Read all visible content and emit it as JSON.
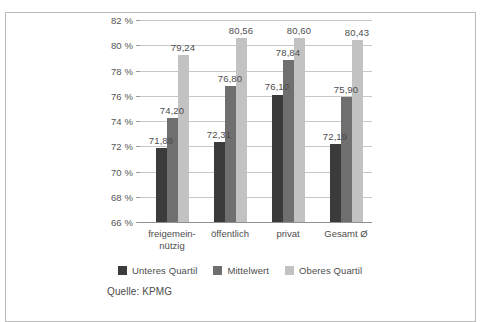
{
  "figure": {
    "source_note": "Quelle: KPMG"
  },
  "colors": {
    "series_lower": "#3b3b3b",
    "series_mean": "#6f6f6f",
    "series_upper": "#c2c2c2",
    "gridline": "#c8c8c8",
    "axis": "#8f8f8f",
    "frame": "#b9b9b9",
    "text": "#4d4d4d",
    "background": "#ffffff"
  },
  "chart_data": {
    "type": "bar",
    "title": "",
    "subtitle": "",
    "xlabel": "",
    "ylabel": "",
    "ylim": [
      66,
      82
    ],
    "ytick_step": 2,
    "ytick_labels": [
      "82 %",
      "80 %",
      "78 %",
      "76 %",
      "74 %",
      "72 %",
      "70 %",
      "68 %",
      "66 %"
    ],
    "ytick_values": [
      82,
      80,
      78,
      76,
      74,
      72,
      70,
      68,
      66
    ],
    "grid": true,
    "legend_position": "bottom",
    "value_label_format": "comma-decimal",
    "categories": [
      "freigemein-\nnützig",
      "öffentlich",
      "privat",
      "Gesamt Ø"
    ],
    "series": [
      {
        "name": "Unteres Quartil",
        "color": "#3b3b3b",
        "values": [
          71.88,
          72.31,
          76.1,
          72.19
        ],
        "labels": [
          "71,88",
          "72,31",
          "76,10",
          "72,19"
        ]
      },
      {
        "name": "Mittelwert",
        "color": "#6f6f6f",
        "values": [
          74.2,
          76.8,
          78.84,
          75.9
        ],
        "labels": [
          "74,20",
          "76,80",
          "78,84",
          "75,90"
        ]
      },
      {
        "name": "Oberes Quartil",
        "color": "#c2c2c2",
        "values": [
          79.24,
          80.56,
          80.6,
          80.43
        ],
        "labels": [
          "79,24",
          "80,56",
          "80,60",
          "80,43"
        ]
      }
    ]
  }
}
